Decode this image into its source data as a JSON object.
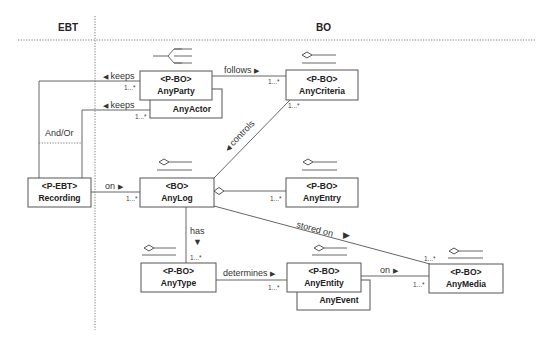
{
  "regions": {
    "left": {
      "label": "EBT"
    },
    "right": {
      "label": "BO"
    }
  },
  "classes": {
    "any_party": {
      "stereotype": "<P-BO>",
      "name": "AnyParty"
    },
    "any_actor": {
      "name": "AnyActor"
    },
    "any_criteria": {
      "stereotype": "<P-BO>",
      "name": "AnyCriteria"
    },
    "recording": {
      "stereotype": "<P-EBT>",
      "name": "Recording"
    },
    "any_log": {
      "stereotype": "<BO>",
      "name": "AnyLog"
    },
    "any_entry": {
      "stereotype": "<P-BO>",
      "name": "AnyEntry"
    },
    "any_type": {
      "stereotype": "<P-BO>",
      "name": "AnyType"
    },
    "any_entity": {
      "stereotype": "<P-BO>",
      "name": "AnyEntity"
    },
    "any_event": {
      "name": "AnyEvent"
    },
    "any_media": {
      "stereotype": "<P-BO>",
      "name": "AnyMedia"
    }
  },
  "associations": {
    "keeps_party": {
      "label": "keeps",
      "direction": "left",
      "multiplicity": "1...*"
    },
    "keeps_actor": {
      "label": "keeps",
      "direction": "left",
      "multiplicity": "1...*"
    },
    "and_or": {
      "label": "And/Or"
    },
    "follows": {
      "label": "follows",
      "direction": "right",
      "multiplicity": "1...*"
    },
    "controls": {
      "label": "controls",
      "direction": "down-left",
      "multiplicity": "1...*"
    },
    "recording_on": {
      "label": "on",
      "direction": "right",
      "multiplicity": "1...*"
    },
    "log_entry": {
      "multiplicity": "1...*"
    },
    "has": {
      "label": "has",
      "direction": "down",
      "multiplicity": "1...*"
    },
    "stored_on": {
      "label": "stored on",
      "direction": "right",
      "multiplicity": "1...*"
    },
    "determines": {
      "label": "determines",
      "direction": "right",
      "multiplicity": "1...*"
    },
    "entity_on": {
      "label": "on",
      "direction": "right",
      "multiplicity": "1...*"
    }
  },
  "arrow_glyphs": {
    "left": "◀",
    "right": "▶",
    "down": "▼"
  }
}
